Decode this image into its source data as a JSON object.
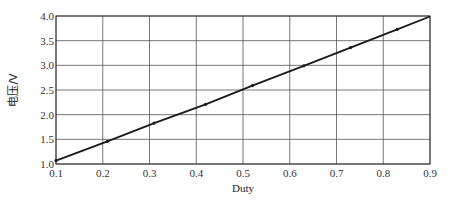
{
  "chart_data": {
    "type": "line",
    "title": "",
    "xlabel": "Duty",
    "ylabel": "电压/V",
    "xlim": [
      0.1,
      0.9
    ],
    "ylim": [
      1.0,
      4.0
    ],
    "x_ticks": [
      "0.1",
      "0.2",
      "0.3",
      "0.4",
      "0.5",
      "0.6",
      "0.7",
      "0.8",
      "0.9"
    ],
    "y_ticks": [
      "1.0",
      "1.5",
      "2.0",
      "2.5",
      "3.0",
      "3.5",
      "4.0"
    ],
    "grid": true,
    "legend": null,
    "series": [
      {
        "name": "电压",
        "x": [
          0.1,
          0.21,
          0.31,
          0.42,
          0.52,
          0.63,
          0.73,
          0.83,
          0.9
        ],
        "values": [
          1.07,
          1.46,
          1.83,
          2.21,
          2.59,
          2.99,
          3.36,
          3.73,
          3.99
        ],
        "markers_at": [
          0.1,
          0.21,
          0.31,
          0.42,
          0.52,
          0.63,
          0.73,
          0.83
        ],
        "color": "#1a1a1a"
      }
    ]
  },
  "colors": {
    "grid": "#555555",
    "line": "#1a1a1a",
    "axis": "#333333"
  }
}
